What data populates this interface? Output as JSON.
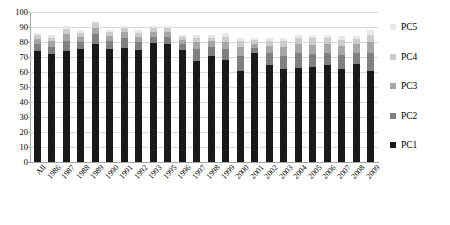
{
  "chart_data": {
    "type": "bar",
    "stacked": true,
    "title": "",
    "xlabel": "",
    "ylabel": "",
    "ylim": [
      0,
      100
    ],
    "ytick_step": 10,
    "yticks": [
      0,
      10,
      20,
      30,
      40,
      50,
      60,
      70,
      80,
      90,
      100
    ],
    "ytick_labels": [
      "0",
      "10",
      "20",
      "30",
      "40",
      "50",
      "60",
      "70",
      "80",
      "90",
      "100"
    ],
    "grid": true,
    "legend_position": "right",
    "categories": [
      "All",
      "1986",
      "1987",
      "1988",
      "1989",
      "1990",
      "1991",
      "1992",
      "1993",
      "1995",
      "1996",
      "1997",
      "1998",
      "1999",
      "2000",
      "2001",
      "2002",
      "2003",
      "2004",
      "2005",
      "2006",
      "2007",
      "2008",
      "2009"
    ],
    "series": [
      {
        "name": "PC1",
        "color": "#1a1a1a",
        "values": [
          74.0,
          72.0,
          74.0,
          75.5,
          78.5,
          75.5,
          76.0,
          75.0,
          79.5,
          78.5,
          74.5,
          67.5,
          71.0,
          68.0,
          60.5,
          73.0,
          64.5,
          62.0,
          63.0,
          63.5,
          65.0,
          62.0,
          65.5,
          61.0
        ]
      },
      {
        "name": "PC2",
        "color": "#808080",
        "values": [
          4.5,
          5.0,
          7.0,
          4.5,
          7.0,
          5.0,
          6.5,
          5.0,
          4.0,
          5.0,
          4.0,
          8.0,
          5.5,
          7.5,
          10.5,
          3.0,
          8.0,
          9.0,
          9.5,
          8.5,
          8.0,
          9.5,
          7.5,
          11.5
        ]
      },
      {
        "name": "PC3",
        "color": "#a6a6a6",
        "values": [
          3.5,
          3.5,
          4.5,
          3.5,
          4.0,
          3.5,
          4.0,
          3.5,
          3.5,
          3.5,
          3.0,
          4.5,
          4.0,
          4.5,
          6.0,
          3.0,
          5.0,
          5.5,
          6.0,
          6.0,
          5.5,
          6.0,
          5.5,
          7.5
        ]
      },
      {
        "name": "PC4",
        "color": "#cccccc",
        "values": [
          2.5,
          2.5,
          3.5,
          2.5,
          3.0,
          2.5,
          3.0,
          2.5,
          2.5,
          2.5,
          2.0,
          3.0,
          2.5,
          3.5,
          3.5,
          2.5,
          3.5,
          4.0,
          4.0,
          4.5,
          4.0,
          4.0,
          3.5,
          5.0
        ]
      },
      {
        "name": "PC5",
        "color": "#e8e8e8",
        "values": [
          1.5,
          2.0,
          2.0,
          2.0,
          1.5,
          1.5,
          1.5,
          2.0,
          1.5,
          1.5,
          1.5,
          2.0,
          2.0,
          2.5,
          2.5,
          1.5,
          2.0,
          2.5,
          2.5,
          2.5,
          2.5,
          2.5,
          2.0,
          3.0
        ]
      }
    ],
    "totals": [
      86.0,
      85.0,
      91.0,
      88.0,
      94.0,
      88.0,
      91.0,
      88.0,
      91.0,
      91.0,
      85.0,
      85.0,
      85.0,
      86.0,
      83.0,
      83.0,
      83.0,
      83.0,
      85.0,
      85.0,
      85.0,
      84.0,
      84.0,
      88.0
    ]
  },
  "legend": {
    "entries": [
      {
        "label": "PC5",
        "color": "#e8e8e8"
      },
      {
        "label": "PC4",
        "color": "#cccccc"
      },
      {
        "label": "PC3",
        "color": "#a6a6a6"
      },
      {
        "label": "PC2",
        "color": "#808080"
      },
      {
        "label": "PC1",
        "color": "#1a1a1a"
      }
    ]
  },
  "colors": {
    "grid": "#d9d9d9",
    "axis": "#a6a6a6",
    "background": "#ffffff",
    "text": "#000000"
  }
}
